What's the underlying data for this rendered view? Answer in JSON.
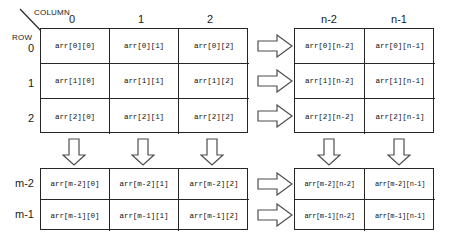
{
  "diagram": {
    "axis_labels": {
      "column": "COLUMN",
      "row": "ROW"
    },
    "column_headers": [
      "0",
      "1",
      "2",
      "n-2",
      "n-1"
    ],
    "row_headers": [
      "0",
      "1",
      "2",
      "m-2",
      "m-1"
    ],
    "colors": {
      "border": "#262626",
      "text": "#111111",
      "background": "#ffffff",
      "arrow_stroke": "#555555"
    },
    "grids": {
      "top_left": {
        "name": "first-rows-first-columns",
        "rows": [
          [
            "arr[0][0]",
            "arr[0][1]",
            "arr[0][2]"
          ],
          [
            "arr[1][0]",
            "arr[1][1]",
            "arr[1][2]"
          ],
          [
            "arr[2][0]",
            "arr[2][1]",
            "arr[2][2]"
          ]
        ]
      },
      "top_right": {
        "name": "first-rows-last-columns",
        "rows": [
          [
            "arr[0][n-2]",
            "arr[0][n-1]"
          ],
          [
            "arr[1][n-2]",
            "arr[1][n-1]"
          ],
          [
            "arr[2][n-2]",
            "arr[2][n-1]"
          ]
        ]
      },
      "bottom_left": {
        "name": "last-rows-first-columns",
        "rows": [
          [
            "arr[m-2][0]",
            "arr[m-2][1]",
            "arr[m-2][2]"
          ],
          [
            "arr[m-1][0]",
            "arr[m-1][1]",
            "arr[m-1][2]"
          ]
        ]
      },
      "bottom_right": {
        "name": "last-rows-last-columns",
        "rows": [
          [
            "arr[m-2][n-2]",
            "arr[m-2][n-1]"
          ],
          [
            "arr[m-1][n-2]",
            "arr[m-1][n-1]"
          ]
        ]
      }
    },
    "arrows": {
      "right_top": [
        "row-0-continues",
        "row-1-continues",
        "row-2-continues"
      ],
      "right_bottom": [
        "row-m-2-continues",
        "row-m-1-continues"
      ],
      "down_left": [
        "column-0-continues",
        "column-1-continues",
        "column-2-continues"
      ],
      "down_right": [
        "column-n-2-continues",
        "column-n-1-continues"
      ]
    }
  }
}
